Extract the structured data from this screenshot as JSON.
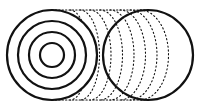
{
  "diagram": {
    "type": "cylinder-cross-section",
    "stroke_color": "#111111",
    "background": "#ffffff",
    "front_face": {
      "cx": 52,
      "cy": 55,
      "rings": [
        45,
        34,
        23,
        12
      ]
    },
    "back_face": {
      "cx": 148,
      "cy": 55,
      "r": 45
    },
    "depth_arcs_offsets": [
      10,
      20,
      30,
      40,
      50,
      60,
      70,
      80
    ]
  }
}
